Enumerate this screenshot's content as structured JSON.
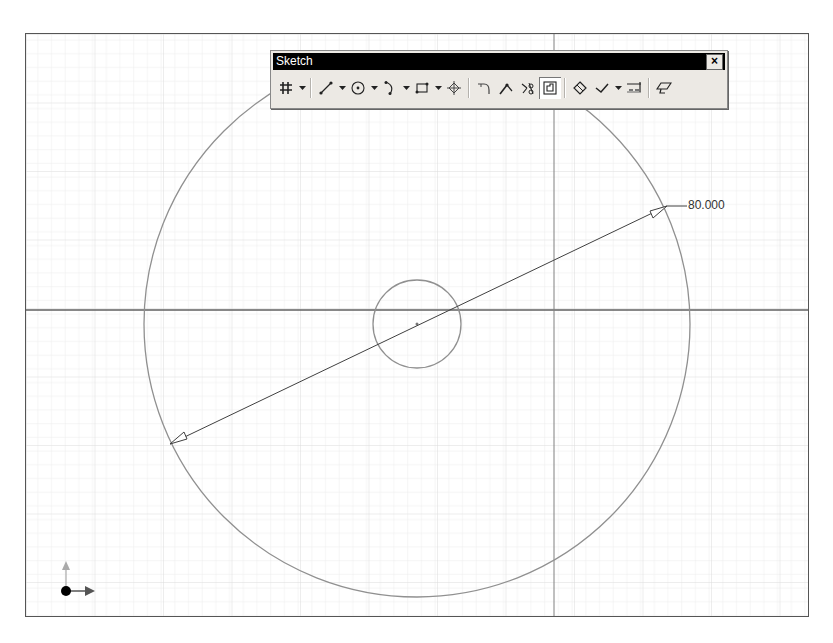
{
  "toolbar": {
    "title": "Sketch",
    "close_label": "×",
    "buttons": [
      {
        "name": "grid-snap",
        "icon": "grid-icon",
        "has_dropdown": true
      },
      {
        "name": "line",
        "icon": "line-icon",
        "has_dropdown": true
      },
      {
        "name": "circle",
        "icon": "circle-icon",
        "has_dropdown": true
      },
      {
        "name": "arc",
        "icon": "arc-icon",
        "has_dropdown": true
      },
      {
        "name": "rectangle",
        "icon": "rectangle-icon",
        "has_dropdown": true
      },
      {
        "name": "point",
        "icon": "point-icon",
        "has_dropdown": false
      },
      {
        "name": "fillet",
        "icon": "fillet-icon",
        "has_dropdown": false
      },
      {
        "name": "extend",
        "icon": "extend-icon",
        "has_dropdown": false
      },
      {
        "name": "trim",
        "icon": "trim-icon",
        "has_dropdown": false
      },
      {
        "name": "offset",
        "icon": "offset-icon",
        "has_dropdown": false,
        "pressed": true
      },
      {
        "name": "constraints",
        "icon": "constraint-icon",
        "has_dropdown": false
      },
      {
        "name": "check",
        "icon": "check-icon",
        "has_dropdown": true
      },
      {
        "name": "dimension",
        "icon": "dimension-icon",
        "has_dropdown": false
      },
      {
        "name": "eraser",
        "icon": "eraser-icon",
        "has_dropdown": false
      }
    ]
  },
  "sketch": {
    "dimension_value": "80.000",
    "large_circle": {
      "cx": 416,
      "cy": 323,
      "r": 273
    },
    "small_circle": {
      "cx": 416,
      "cy": 323,
      "r": 44
    },
    "dimension_line": {
      "x1": 169,
      "y1": 443,
      "x2": 666,
      "y2": 205
    },
    "axis_horizontal_y": 309,
    "axis_vertical_x": 553,
    "colors": {
      "geometry": "#909090",
      "axis": "#606060",
      "grid": "#e6e6e6",
      "grid_major": "#d8d8d8",
      "dimension": "#404040"
    }
  },
  "triad": {
    "x_axis_color": "#555555",
    "y_axis_color": "#aaaaaa",
    "origin_color": "#000000"
  }
}
